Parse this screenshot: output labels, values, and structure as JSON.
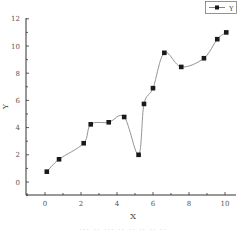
{
  "chart_data": {
    "type": "line",
    "title": "",
    "xlabel": "X",
    "ylabel": "Y",
    "xlim": [
      -1,
      11
    ],
    "ylim": [
      -1,
      12
    ],
    "xticks": [
      0,
      2,
      4,
      6,
      8,
      10
    ],
    "yticks": [
      0,
      2,
      4,
      6,
      8,
      10,
      12
    ],
    "grid": false,
    "legend": {
      "position": "top-right",
      "entries": [
        "Y"
      ]
    },
    "series": [
      {
        "name": "Y",
        "marker": "square",
        "line": "smooth-spline",
        "x": [
          0.1,
          0.78,
          2.15,
          2.54,
          3.54,
          4.4,
          5.2,
          5.5,
          6.0,
          6.63,
          7.57,
          8.83,
          9.57,
          10.07
        ],
        "y": [
          0.76,
          1.67,
          2.85,
          4.24,
          4.39,
          4.78,
          2.0,
          5.74,
          6.9,
          9.5,
          8.46,
          9.1,
          10.5,
          11.0
        ]
      }
    ]
  },
  "footer_text": "... .. ...   .. .. .. .. .."
}
